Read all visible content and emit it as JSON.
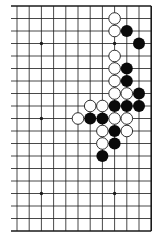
{
  "diagram": {
    "type": "go-board-partial",
    "board_size": 19,
    "visible_columns": 12,
    "visible_rows": 19,
    "open_edges": [
      "left"
    ],
    "colors": {
      "background": "#ffffff",
      "line": "#1a1a1a",
      "black_stone": "#0a0a0a",
      "white_stone_fill": "#ffffff",
      "white_stone_stroke": "#1a1a1a"
    },
    "grid": {
      "x0": 17,
      "dx": 12.2,
      "y0": 6,
      "dy": 12.5,
      "left_stub": 6
    },
    "star_points": [
      [
        3,
        4
      ],
      [
        9,
        4
      ],
      [
        3,
        10
      ],
      [
        9,
        10
      ],
      [
        3,
        16
      ],
      [
        9,
        16
      ]
    ],
    "stones": {
      "white": [
        [
          9,
          2
        ],
        [
          9,
          3
        ],
        [
          9,
          5
        ],
        [
          9,
          6
        ],
        [
          9,
          7
        ],
        [
          9,
          8
        ],
        [
          10,
          8
        ],
        [
          7,
          9
        ],
        [
          8,
          9
        ],
        [
          6,
          10
        ],
        [
          9,
          10
        ],
        [
          10,
          10
        ],
        [
          8,
          11
        ],
        [
          10,
          11
        ],
        [
          8,
          12
        ]
      ],
      "black": [
        [
          10,
          3
        ],
        [
          11,
          4
        ],
        [
          10,
          6
        ],
        [
          10,
          7
        ],
        [
          11,
          8
        ],
        [
          9,
          9
        ],
        [
          10,
          9
        ],
        [
          11,
          9
        ],
        [
          7,
          10
        ],
        [
          8,
          10
        ],
        [
          9,
          11
        ],
        [
          9,
          12
        ],
        [
          8,
          13
        ]
      ]
    }
  }
}
